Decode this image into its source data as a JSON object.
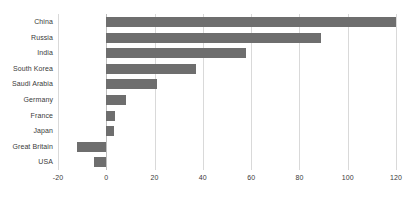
{
  "chart_data": {
    "type": "bar",
    "orientation": "horizontal",
    "title": "",
    "subtitle": "",
    "xlabel": "",
    "ylabel": "",
    "categories": [
      "China",
      "Russia",
      "India",
      "South Korea",
      "Saudi Arabia",
      "Germany",
      "France",
      "Japan",
      "Great Britain",
      "USA"
    ],
    "values": [
      120,
      89,
      58,
      37,
      21,
      8,
      3.5,
      3,
      -12,
      -5
    ],
    "series": [
      {
        "name": "",
        "values": [
          120,
          89,
          58,
          37,
          21,
          8,
          3.5,
          3,
          -12,
          -5
        ]
      }
    ],
    "xlim": [
      -20,
      120
    ],
    "xticks": [
      -20,
      0,
      20,
      40,
      60,
      80,
      100,
      120
    ],
    "xtick_labels": [
      "-20",
      "0",
      "20",
      "40",
      "60",
      "80",
      "100",
      "120"
    ],
    "grid": true,
    "grid_axis": "x",
    "legend": false,
    "legend_position": "none",
    "bar_color": "#6e6e6e",
    "gridline_color": "#d9d9d9",
    "zero_line_color": "#bdbdbd",
    "background_color": "#ffffff",
    "text_color": "#3a3a3a",
    "annotations": []
  }
}
